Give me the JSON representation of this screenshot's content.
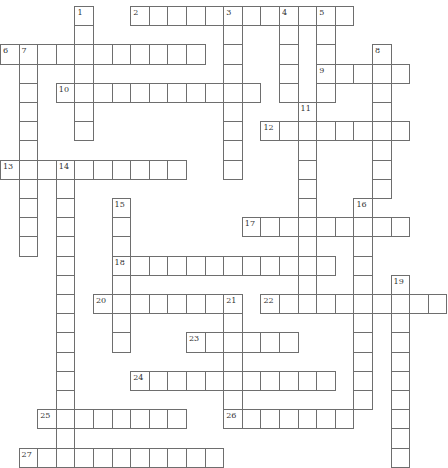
{
  "puzzle": {
    "cell_w": 18.6,
    "cell_h": 19.2,
    "offset_x": 0,
    "offset_y": 6,
    "entries": [
      {
        "num": "1",
        "dir": "down",
        "row": 0,
        "col": 4,
        "len": 7
      },
      {
        "num": "2",
        "dir": "across",
        "row": 0,
        "col": 7,
        "len": 12
      },
      {
        "num": "3",
        "dir": "down",
        "row": 0,
        "col": 12,
        "len": 9
      },
      {
        "num": "4",
        "dir": "down",
        "row": 0,
        "col": 15,
        "len": 5
      },
      {
        "num": "5",
        "dir": "down",
        "row": 0,
        "col": 17,
        "len": 5
      },
      {
        "num": "6",
        "dir": "across",
        "row": 2,
        "col": 0,
        "len": 11
      },
      {
        "num": "7",
        "dir": "down",
        "row": 2,
        "col": 1,
        "len": 11
      },
      {
        "num": "8",
        "dir": "down",
        "row": 2,
        "col": 20,
        "len": 8
      },
      {
        "num": "9",
        "dir": "across",
        "row": 3,
        "col": 17,
        "len": 5
      },
      {
        "num": "10",
        "dir": "across",
        "row": 4,
        "col": 3,
        "len": 11
      },
      {
        "num": "11",
        "dir": "down",
        "row": 5,
        "col": 16,
        "len": 11
      },
      {
        "num": "12",
        "dir": "across",
        "row": 6,
        "col": 14,
        "len": 8
      },
      {
        "num": "13",
        "dir": "across",
        "row": 8,
        "col": 0,
        "len": 10
      },
      {
        "num": "14",
        "dir": "down",
        "row": 8,
        "col": 3,
        "len": 16
      },
      {
        "num": "15",
        "dir": "down",
        "row": 10,
        "col": 6,
        "len": 8
      },
      {
        "num": "16",
        "dir": "down",
        "row": 10,
        "col": 19,
        "len": 11
      },
      {
        "num": "17",
        "dir": "across",
        "row": 11,
        "col": 13,
        "len": 9
      },
      {
        "num": "18",
        "dir": "across",
        "row": 13,
        "col": 6,
        "len": 12
      },
      {
        "num": "19",
        "dir": "down",
        "row": 14,
        "col": 21,
        "len": 10
      },
      {
        "num": "20",
        "dir": "across",
        "row": 15,
        "col": 5,
        "len": 8
      },
      {
        "num": "21",
        "dir": "down",
        "row": 15,
        "col": 12,
        "len": 7
      },
      {
        "num": "22",
        "dir": "across",
        "row": 15,
        "col": 14,
        "len": 10
      },
      {
        "num": "23",
        "dir": "across",
        "row": 17,
        "col": 10,
        "len": 6
      },
      {
        "num": "24",
        "dir": "across",
        "row": 19,
        "col": 7,
        "len": 11
      },
      {
        "num": "25",
        "dir": "across",
        "row": 21,
        "col": 2,
        "len": 8
      },
      {
        "num": "26",
        "dir": "across",
        "row": 21,
        "col": 12,
        "len": 7
      },
      {
        "num": "27",
        "dir": "across",
        "row": 23,
        "col": 1,
        "len": 11
      }
    ]
  }
}
